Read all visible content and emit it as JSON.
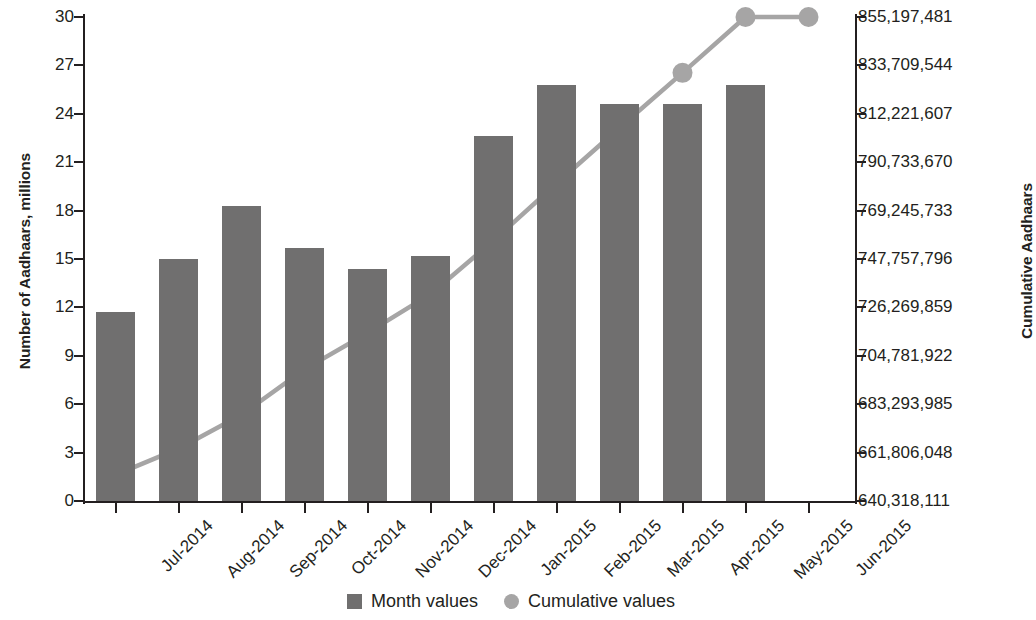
{
  "chart_data": {
    "type": "bar",
    "title": "",
    "subtitle": "",
    "xlabel": "",
    "ylabel": "Number of Aadhaars, millions",
    "y2label": "Cumulative Aadhaars",
    "grid": false,
    "legend_position": "bottom",
    "categories": [
      "Jul-2014",
      "Aug-2014",
      "Sep-2014",
      "Oct-2014",
      "Nov-2014",
      "Dec-2014",
      "Jan-2015",
      "Feb-2015",
      "Mar-2015",
      "Apr-2015",
      "May-2015",
      "Jun-2015"
    ],
    "ylim": [
      0,
      30
    ],
    "yticks": [
      0,
      3,
      6,
      9,
      12,
      15,
      18,
      21,
      24,
      27,
      30
    ],
    "ytick_labels": [
      "0",
      "3",
      "6",
      "9",
      "12",
      "15",
      "18",
      "21",
      "24",
      "27",
      "30"
    ],
    "y2lim": [
      640318111,
      855197481
    ],
    "y2ticks": [
      640318111,
      661806048,
      683293985,
      704781922,
      726269859,
      747757796,
      769245733,
      790733670,
      812221607,
      833709544,
      855197481
    ],
    "y2tick_labels": [
      "640,318,111",
      "661,806,048",
      "683,293,985",
      "704,781,922",
      "726,269,859",
      "747,757,796",
      "769,245,733",
      "790,733,670",
      "812,221,607",
      "833,709,544",
      "855,197,481"
    ],
    "series": [
      {
        "name": "Month values",
        "type": "bar",
        "axis": "left",
        "color": "#706f6f",
        "marker": "square",
        "values": [
          11.7,
          15.0,
          18.3,
          15.7,
          14.4,
          15.2,
          22.6,
          25.8,
          24.6,
          24.6,
          25.8,
          null
        ]
      },
      {
        "name": "Cumulative values",
        "type": "line",
        "axis": "right",
        "color": "#a6a5a5",
        "marker": "circle",
        "values": [
          651920000,
          663560000,
          678610000,
          698750000,
          714930000,
          732140000,
          755920000,
          781260000,
          806000000,
          830410000,
          855197481,
          855197481
        ]
      }
    ],
    "legend": [
      {
        "label": "Month values",
        "marker": "square",
        "color": "#706f6f"
      },
      {
        "label": "Cumulative values",
        "marker": "circle",
        "color": "#a6a5a5"
      }
    ],
    "colors": {
      "bar": "#706f6f",
      "line": "#a6a5a5",
      "marker": "#a6a5a5",
      "axis": "#231f20",
      "text": "#231f20",
      "background": "#ffffff"
    }
  }
}
